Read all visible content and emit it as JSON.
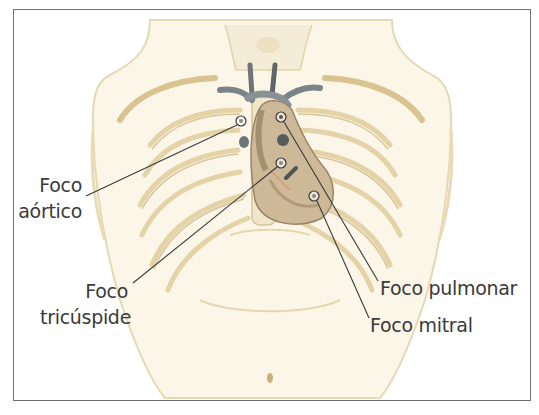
{
  "figure": {
    "colors": {
      "frame": "#6f6f6f",
      "skin": "#efe4c6",
      "skin_outline": "#d9c79a",
      "bone": "#f6efdc",
      "bone_shadow": "#b59c6a",
      "heart": "#9a8468",
      "vessels": "#6d7479",
      "leader_line": "#3a3a3a",
      "text": "#3a3a3a"
    },
    "labels": [
      {
        "id": "aortic",
        "line1": "Foco",
        "line2": "aórtico",
        "marker": [
          241,
          121
        ],
        "anchor": [
          85,
          196
        ]
      },
      {
        "id": "tricuspid",
        "line1": "Foco",
        "line2": "tricúspide",
        "marker": [
          281,
          163
        ],
        "anchor": [
          133,
          283
        ]
      },
      {
        "id": "pulmonary",
        "line1": "Foco pulmonar",
        "line2": "",
        "marker": [
          281,
          117
        ],
        "anchor": [
          379,
          281
        ]
      },
      {
        "id": "mitral",
        "line1": "Foco mitral",
        "line2": "",
        "marker": [
          314,
          196
        ],
        "anchor": [
          369,
          318
        ]
      }
    ]
  }
}
